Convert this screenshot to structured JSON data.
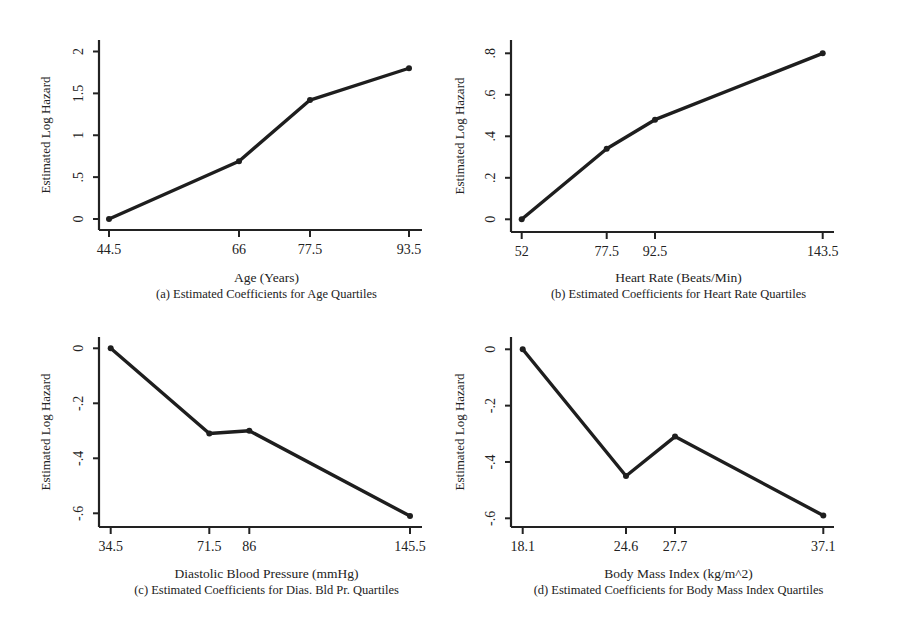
{
  "chart_data": [
    {
      "type": "line",
      "panel": "a",
      "title": "(a) Estimated Coefficients for Age Quartiles",
      "xlabel": "Age (Years)",
      "ylabel": "Estimated Log Hazard",
      "x": [
        44.5,
        66,
        77.5,
        93.5
      ],
      "x_tick_labels": [
        "44.5",
        "66",
        "77.5",
        "93.5"
      ],
      "values": [
        0,
        0.69,
        1.42,
        1.8
      ],
      "y_ticks": [
        0,
        0.5,
        1,
        1.5,
        2
      ],
      "y_tick_labels": [
        "0",
        ".5",
        "1",
        "1.5",
        "2"
      ],
      "ylim": [
        0,
        2
      ],
      "grid": false
    },
    {
      "type": "line",
      "panel": "b",
      "title": "(b) Estimated Coefficients for Heart Rate Quartiles",
      "xlabel": "Heart Rate (Beats/Min)",
      "ylabel": "Estimated Log Hazard",
      "x": [
        52,
        77.5,
        92.5,
        143.5
      ],
      "x_tick_labels": [
        "52",
        "77.5",
        "92.5",
        "143.5"
      ],
      "values": [
        0,
        0.34,
        0.48,
        0.8
      ],
      "y_ticks": [
        0,
        0.2,
        0.4,
        0.6,
        0.8
      ],
      "y_tick_labels": [
        "0",
        ".2",
        ".4",
        ".6",
        ".8"
      ],
      "ylim": [
        0,
        0.8
      ],
      "grid": false
    },
    {
      "type": "line",
      "panel": "c",
      "title": "(c) Estimated Coefficients for Dias. Bld Pr. Quartiles",
      "xlabel": "Diastolic Blood Pressure (mmHg)",
      "ylabel": "Estimated Log Hazard",
      "x": [
        34.5,
        71.5,
        86,
        145.5
      ],
      "x_tick_labels": [
        "34.5",
        "71.5",
        "86",
        "145.5"
      ],
      "values": [
        0,
        -0.31,
        -0.3,
        -0.61
      ],
      "y_ticks": [
        0,
        -0.2,
        -0.4,
        -0.6
      ],
      "y_tick_labels": [
        "0",
        "-.2",
        "-.4",
        "-.6"
      ],
      "ylim": [
        -0.6,
        0
      ],
      "grid": false
    },
    {
      "type": "line",
      "panel": "d",
      "title": "(d) Estimated Coefficients for Body Mass Index Quartiles",
      "xlabel": "Body Mass Index (kg/m^2)",
      "ylabel": "Estimated Log Hazard",
      "x": [
        18.1,
        24.6,
        27.7,
        37.1
      ],
      "x_tick_labels": [
        "18.1",
        "24.6",
        "27.7",
        "37.1"
      ],
      "values": [
        0,
        -0.45,
        -0.31,
        -0.59
      ],
      "y_ticks": [
        0,
        -0.2,
        -0.4,
        -0.6
      ],
      "y_tick_labels": [
        "0",
        "-.2",
        "-.4",
        "-.6"
      ],
      "ylim": [
        -0.6,
        0
      ],
      "grid": false
    }
  ]
}
